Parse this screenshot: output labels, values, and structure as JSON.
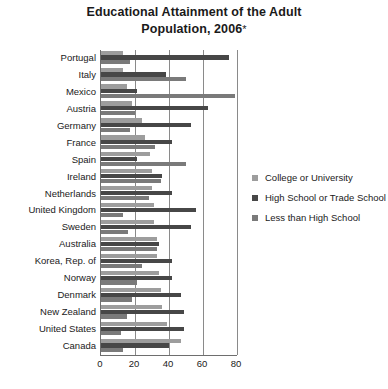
{
  "chart_data": {
    "type": "bar",
    "orientation": "horizontal",
    "title_line1": "Educational Attainment of the Adult",
    "title_line2": "Population, 2006",
    "title_footnote_marker": "*",
    "xlabel": "",
    "ylabel": "",
    "xlim": [
      0,
      80
    ],
    "xticks": [
      0,
      20,
      40,
      60,
      80
    ],
    "xtick_labels": [
      "0",
      "20",
      "40",
      "60",
      "80"
    ],
    "grid": true,
    "grid_axis": "x",
    "legend_position": "right",
    "categories": [
      "Portugal",
      "Italy",
      "Mexico",
      "Austria",
      "Germany",
      "France",
      "Spain",
      "Ireland",
      "Netherlands",
      "United Kingdom",
      "Sweden",
      "Australia",
      "Korea, Rep. of",
      "Norway",
      "Denmark",
      "New Zealand",
      "United States",
      "Canada"
    ],
    "series": [
      {
        "name": "College or University",
        "color": "#9d9d9d",
        "values": [
          13,
          13,
          15,
          18,
          24,
          26,
          29,
          30,
          30,
          31,
          31,
          33,
          33,
          34,
          35,
          36,
          39,
          47
        ]
      },
      {
        "name": "High School or Trade School",
        "color": "#474747",
        "values": [
          75,
          38,
          21,
          63,
          53,
          42,
          21,
          36,
          42,
          56,
          53,
          34,
          42,
          42,
          47,
          49,
          49,
          40
        ]
      },
      {
        "name": "Less than High School",
        "color": "#7a7a7a",
        "values": [
          17,
          50,
          79,
          20,
          17,
          32,
          50,
          35,
          28,
          13,
          16,
          33,
          24,
          21,
          18,
          15,
          12,
          13
        ]
      }
    ]
  },
  "legend": {
    "items": [
      {
        "label": "College or University",
        "swatch_class": "sw-college"
      },
      {
        "label": "High School or Trade School",
        "swatch_class": "sw-high"
      },
      {
        "label": "Less than High School",
        "swatch_class": "sw-less"
      }
    ]
  }
}
